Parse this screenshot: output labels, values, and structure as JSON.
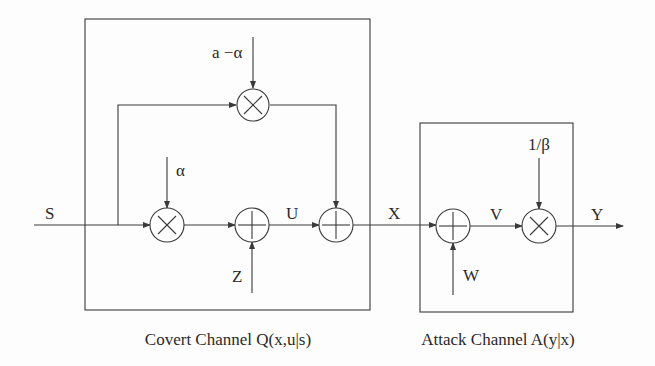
{
  "diagram": {
    "type": "block-diagram",
    "blocks": [
      {
        "id": "covert",
        "caption": "Covert Channel Q(x,u|s)"
      },
      {
        "id": "attack",
        "caption": "Attack Channel A(y|x)"
      }
    ],
    "signals": {
      "input": "S",
      "alpha": "α",
      "a_minus_alpha": "a −α",
      "z": "Z",
      "u": "U",
      "x": "X",
      "w": "W",
      "v": "V",
      "inv_beta": "1/β",
      "output": "Y"
    },
    "nodes": [
      {
        "id": "mul-alpha",
        "op": "multiply",
        "symbol": "×",
        "inputs": [
          "S",
          "α"
        ]
      },
      {
        "id": "mul-a-alpha",
        "op": "multiply",
        "symbol": "×",
        "inputs": [
          "S",
          "a −α"
        ]
      },
      {
        "id": "add-z",
        "op": "add",
        "symbol": "+",
        "inputs": [
          "αS",
          "Z"
        ],
        "output": "U"
      },
      {
        "id": "add-u",
        "op": "add",
        "symbol": "+",
        "inputs": [
          "U",
          "(a−α)S"
        ],
        "output": "X"
      },
      {
        "id": "add-w",
        "op": "add",
        "symbol": "+",
        "inputs": [
          "X",
          "W"
        ],
        "output": "V"
      },
      {
        "id": "mul-beta",
        "op": "multiply",
        "symbol": "×",
        "inputs": [
          "V",
          "1/β"
        ],
        "output": "Y"
      }
    ]
  }
}
